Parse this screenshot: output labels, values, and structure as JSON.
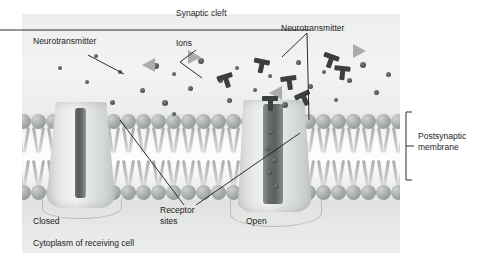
{
  "figure": {
    "type": "biology-diagram",
    "background_color": "#ffffff",
    "panel_color": "#eceeed"
  },
  "labels": {
    "synaptic_cleft": "Synaptic cleft",
    "neurotransmitter_left": "Neurotransmitter",
    "ions": "Ions",
    "neurotransmitter_right": "Neurotransmitter",
    "postsynaptic_membrane": "Postsynaptic\nmembrane",
    "receptor_sites": "Receptor\nsites",
    "closed": "Closed",
    "open": "Open",
    "cytoplasm": "Cytoplasm of receiving cell"
  },
  "structures": [
    {
      "name": "closed-ion-channel",
      "state": "Closed",
      "side": "left"
    },
    {
      "name": "open-ion-channel",
      "state": "Open",
      "side": "right"
    },
    {
      "name": "phospholipid-bilayer",
      "rows": 2
    }
  ],
  "particles": {
    "ion_label": "Ions",
    "ion_color": "#4f5351",
    "neurotransmitter_color": "#3b3f3d",
    "vesicle_triangle_color": "#a9adaa",
    "ion_count": 26,
    "neurotransmitter_count": 6,
    "triangle_count": 4
  },
  "ions_positions": [
    [
      36,
      52
    ],
    [
      72,
      40
    ],
    [
      63,
      66
    ],
    [
      96,
      56
    ],
    [
      118,
      74
    ],
    [
      88,
      86
    ],
    [
      131,
      49
    ],
    [
      150,
      58
    ],
    [
      140,
      86
    ],
    [
      166,
      72
    ],
    [
      176,
      44
    ],
    [
      196,
      64
    ],
    [
      205,
      84
    ],
    [
      213,
      52
    ],
    [
      231,
      74
    ],
    [
      246,
      60
    ],
    [
      260,
      88
    ],
    [
      274,
      46
    ],
    [
      286,
      70
    ],
    [
      300,
      56
    ],
    [
      312,
      84
    ],
    [
      325,
      64
    ],
    [
      338,
      48
    ],
    [
      352,
      76
    ],
    [
      364,
      58
    ],
    [
      150,
      98
    ]
  ],
  "nt_positions": [
    [
      196,
      60
    ],
    [
      231,
      45
    ],
    [
      259,
      62
    ],
    [
      300,
      40
    ],
    [
      274,
      78
    ],
    [
      312,
      52
    ]
  ],
  "triangle_positions": [
    [
      120,
      44
    ],
    [
      166,
      36
    ],
    [
      247,
      72
    ],
    [
      331,
      30
    ]
  ],
  "channel_ions_open": [
    [
      6,
      30
    ],
    [
      3,
      46
    ],
    [
      10,
      58
    ],
    [
      5,
      70
    ],
    [
      12,
      84
    ]
  ]
}
